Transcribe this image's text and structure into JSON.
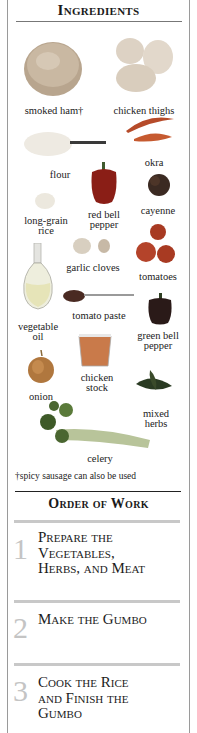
{
  "ingredients": {
    "heading": "Ingredients",
    "items": [
      {
        "label": "smoked ham†",
        "icon": "ham-icon"
      },
      {
        "label": "chicken thighs",
        "icon": "chicken-icon"
      },
      {
        "label": "okra",
        "icon": "okra-icon"
      },
      {
        "label": "flour",
        "icon": "flour-icon"
      },
      {
        "label_lines": [
          "red bell",
          "pepper"
        ],
        "icon": "red-pepper-icon"
      },
      {
        "label": "cayenne",
        "icon": "cayenne-icon"
      },
      {
        "label_lines": [
          "long-grain",
          "rice"
        ],
        "icon": "rice-icon"
      },
      {
        "label": "garlic cloves",
        "icon": "garlic-icon"
      },
      {
        "label": "tomatoes",
        "icon": "tomato-icon"
      },
      {
        "label_lines": [
          "vegetable",
          "oil"
        ],
        "icon": "oil-bottle-icon"
      },
      {
        "label": "tomato paste",
        "icon": "tomato-paste-icon"
      },
      {
        "label_lines": [
          "green bell",
          "pepper"
        ],
        "icon": "green-pepper-icon"
      },
      {
        "label": "onion",
        "icon": "onion-icon"
      },
      {
        "label_lines": [
          "chicken",
          "stock"
        ],
        "icon": "stock-icon"
      },
      {
        "label_lines": [
          "mixed",
          "herbs"
        ],
        "icon": "herbs-icon"
      },
      {
        "label": "celery",
        "icon": "celery-icon"
      }
    ],
    "footnote": "†spicy sausage can also be used"
  },
  "order_of_work": {
    "heading": "Order of Work",
    "steps": [
      {
        "number": "1",
        "title_lines": [
          "Prepare the",
          "Vegetables,",
          "Herbs, and Meat"
        ]
      },
      {
        "number": "2",
        "title_lines": [
          "Make the Gumbo"
        ]
      },
      {
        "number": "3",
        "title_lines": [
          "Cook the Rice",
          "and Finish the",
          "Gumbo"
        ]
      }
    ]
  },
  "colors": {
    "text": "#1a1a1a",
    "step_number": "#c4c4c4",
    "divider_grey": "#c8c8c8",
    "frame": "#9a9a9a"
  }
}
